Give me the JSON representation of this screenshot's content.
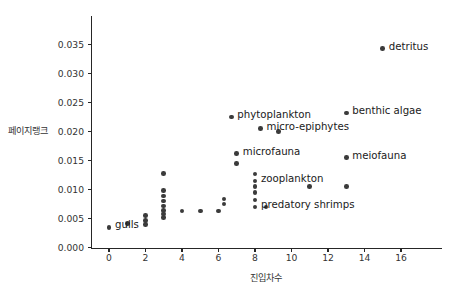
{
  "chart_data": {
    "type": "scatter",
    "title": "",
    "xlabel": "진입차수",
    "ylabel": "페이지랭크",
    "xlim": [
      -1.2,
      17.3
    ],
    "ylim": [
      -0.0008,
      0.0372
    ],
    "grid": false,
    "legend": null,
    "xticks": [
      0,
      2,
      4,
      6,
      8,
      10,
      12,
      14,
      16
    ],
    "xtick_labels": [
      "0",
      "2",
      "4",
      "6",
      "8",
      "10",
      "12",
      "14",
      "16"
    ],
    "yticks": [
      0.0,
      0.005,
      0.01,
      0.015,
      0.02,
      0.025,
      0.03,
      0.035
    ],
    "ytick_labels": [
      "0.000",
      "0.005",
      "0.010",
      "0.015",
      "0.020",
      "0.025",
      "0.030",
      "0.035"
    ],
    "marker_color": "#3b3b3b",
    "labeled_points": [
      {
        "label": "detritus",
        "x": 15.0,
        "y": 0.0343,
        "dx": 6,
        "dy": -3
      },
      {
        "label": "benthic algae",
        "x": 13.0,
        "y": 0.0232,
        "dx": 6,
        "dy": -3
      },
      {
        "label": "phytoplankton",
        "x": 6.7,
        "y": 0.0225,
        "dx": 6,
        "dy": -3
      },
      {
        "label": "micro-epiphytes",
        "x": 8.3,
        "y": 0.0205,
        "dx": 6,
        "dy": -3
      },
      {
        "label": "microfauna",
        "x": 7.0,
        "y": 0.0162,
        "dx": 6,
        "dy": -3
      },
      {
        "label": "meiofauna",
        "x": 13.0,
        "y": 0.0155,
        "dx": 6,
        "dy": -3
      },
      {
        "label": "zooplankton",
        "x": 8.0,
        "y": 0.0115,
        "dx": 6,
        "dy": -3
      },
      {
        "label": "predatory shrimps",
        "x": 8.0,
        "y": 0.007,
        "dx": 6,
        "dy": -3
      },
      {
        "label": "gulls",
        "x": 0.0,
        "y": 0.0035,
        "dx": 6,
        "dy": -3
      }
    ],
    "unlabeled_points": [
      {
        "x": 1.0,
        "y": 0.0042
      },
      {
        "x": 2.0,
        "y": 0.004
      },
      {
        "x": 2.0,
        "y": 0.0047
      },
      {
        "x": 2.0,
        "y": 0.0055
      },
      {
        "x": 3.0,
        "y": 0.0128
      },
      {
        "x": 3.0,
        "y": 0.0098
      },
      {
        "x": 3.0,
        "y": 0.0089
      },
      {
        "x": 3.0,
        "y": 0.008
      },
      {
        "x": 3.0,
        "y": 0.0072
      },
      {
        "x": 3.0,
        "y": 0.0064
      },
      {
        "x": 3.0,
        "y": 0.0058
      },
      {
        "x": 3.0,
        "y": 0.0052
      },
      {
        "x": 4.0,
        "y": 0.0063
      },
      {
        "x": 5.0,
        "y": 0.0063
      },
      {
        "x": 6.0,
        "y": 0.0063
      },
      {
        "x": 6.3,
        "y": 0.0075
      },
      {
        "x": 6.3,
        "y": 0.0084
      },
      {
        "x": 7.0,
        "y": 0.0145
      },
      {
        "x": 8.0,
        "y": 0.0127
      },
      {
        "x": 8.0,
        "y": 0.0105
      },
      {
        "x": 8.0,
        "y": 0.0095
      },
      {
        "x": 8.0,
        "y": 0.0082
      },
      {
        "x": 8.6,
        "y": 0.007
      },
      {
        "x": 9.3,
        "y": 0.02
      },
      {
        "x": 11.0,
        "y": 0.0105
      },
      {
        "x": 13.0,
        "y": 0.0105
      }
    ]
  }
}
